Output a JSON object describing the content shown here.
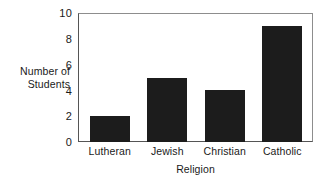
{
  "chart_data": {
    "type": "bar",
    "title": "",
    "categories": [
      "Lutheran",
      "Jewish",
      "Christian",
      "Catholic"
    ],
    "values": [
      2,
      5,
      4,
      9
    ],
    "xlabel": "Religion",
    "ylabel": "Number of Students",
    "ylabel_lines": [
      "Number of",
      "Students"
    ],
    "ylim": [
      0,
      10
    ],
    "ytick_labels": [
      "0",
      "2",
      "4",
      "6",
      "8",
      "10"
    ],
    "ytick_values": [
      0,
      2,
      4,
      6,
      8,
      10
    ],
    "grid": false,
    "legend": false,
    "colors": {
      "bar": "#1c1c1c",
      "axis": "#555555",
      "frame": "#8d8d8d",
      "background": "#ffffff",
      "text": "#1a1a1a"
    }
  }
}
